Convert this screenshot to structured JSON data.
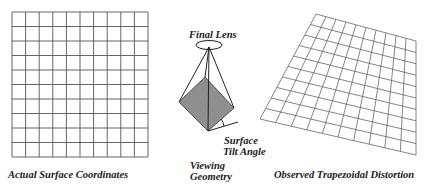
{
  "colors": {
    "grid_line": "#555555",
    "surface_fill": "#8f8f8f",
    "text": "#222222",
    "background": "#ffffff"
  },
  "panels": {
    "actual": {
      "caption": "Actual Surface Coordinates",
      "grid": {
        "columns": 10,
        "rows": 10,
        "x": 12,
        "y": 12,
        "width": 136,
        "height": 145
      }
    },
    "geometry": {
      "caption_line1": "Viewing",
      "caption_line2": "Geometry",
      "lens_label": "Final Lens",
      "tilt_label_line1": "Surface",
      "tilt_label_line2": "Tilt Angle"
    },
    "observed": {
      "caption": "Observed Trapezoidal Distortion",
      "grid": {
        "columns": 10,
        "rows": 10,
        "corners": {
          "tl": [
            316,
            14
          ],
          "tr": [
            416,
            41
          ],
          "br": [
            416,
            155
          ],
          "bl": [
            260,
            119
          ]
        }
      }
    }
  }
}
